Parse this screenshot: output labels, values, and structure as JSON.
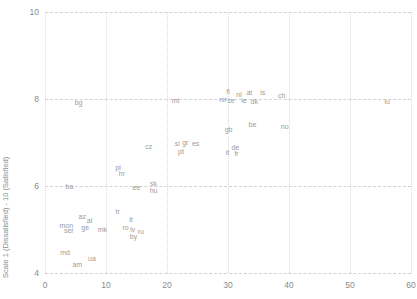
{
  "chart_data": {
    "type": "scatter",
    "title": "",
    "subtitle": "",
    "xlabel": "",
    "ylabel": "Life satisfaction",
    "ylabel_line2": "Scale 1 (Dissatisfied) - 10 (Satisfied)",
    "xlim": [
      0,
      60
    ],
    "ylim": [
      4,
      10
    ],
    "xticks": [
      0,
      10,
      20,
      30,
      40,
      50,
      60
    ],
    "yticks": [
      4,
      6,
      8,
      10
    ],
    "xtick_labels": [
      "0",
      "10",
      "20",
      "30",
      "40",
      "50",
      "60"
    ],
    "ytick_labels": [
      "4",
      "6",
      "8",
      "10"
    ],
    "grid": true,
    "legend": "none",
    "label_color": "#9b9b9b",
    "grid_color": "#dadada",
    "background": "#ffffff",
    "points": [
      {
        "label": "bg",
        "x": 5.5,
        "y": 7.92
      },
      {
        "label": "mt",
        "x": 21.4,
        "y": 7.97
      },
      {
        "label": "lu",
        "x": 56.1,
        "y": 7.96
      },
      {
        "label": "fi",
        "x": 30.0,
        "y": 8.18
      },
      {
        "label": "nir",
        "x": 29.2,
        "y": 8.0
      },
      {
        "label": "se",
        "x": 30.5,
        "y": 7.98
      },
      {
        "label": "nl",
        "x": 31.8,
        "y": 8.12
      },
      {
        "label": "ie",
        "x": 32.6,
        "y": 7.98
      },
      {
        "label": "at",
        "x": 33.5,
        "y": 8.17
      },
      {
        "label": "dk",
        "x": 34.3,
        "y": 7.95
      },
      {
        "label": "is",
        "x": 35.7,
        "y": 8.17
      },
      {
        "label": "ch",
        "x": 38.8,
        "y": 8.09
      },
      {
        "label": "gb",
        "x": 30.1,
        "y": 7.32
      },
      {
        "label": "be",
        "x": 34.0,
        "y": 7.43
      },
      {
        "label": "no",
        "x": 39.3,
        "y": 7.38
      },
      {
        "label": "cz",
        "x": 17.0,
        "y": 6.93
      },
      {
        "label": "si",
        "x": 21.7,
        "y": 6.99
      },
      {
        "label": "gr",
        "x": 23.0,
        "y": 7.01
      },
      {
        "label": "es",
        "x": 24.7,
        "y": 6.99
      },
      {
        "label": "pt",
        "x": 22.3,
        "y": 6.8
      },
      {
        "label": "de",
        "x": 31.2,
        "y": 6.9
      },
      {
        "label": "it",
        "x": 29.9,
        "y": 6.78
      },
      {
        "label": "fr",
        "x": 31.4,
        "y": 6.76
      },
      {
        "label": "pl",
        "x": 12.0,
        "y": 6.43
      },
      {
        "label": "hr",
        "x": 12.6,
        "y": 6.29
      },
      {
        "label": "ba",
        "x": 4.0,
        "y": 6.0
      },
      {
        "label": "ee",
        "x": 15.0,
        "y": 5.98
      },
      {
        "label": "sk",
        "x": 17.8,
        "y": 6.06
      },
      {
        "label": "hu",
        "x": 17.8,
        "y": 5.9
      },
      {
        "label": "tr",
        "x": 11.9,
        "y": 5.42
      },
      {
        "label": "az",
        "x": 6.1,
        "y": 5.32
      },
      {
        "label": "al",
        "x": 7.3,
        "y": 5.22
      },
      {
        "label": "lt",
        "x": 14.1,
        "y": 5.23
      },
      {
        "label": "mon",
        "x": 3.5,
        "y": 5.1
      },
      {
        "label": "ge",
        "x": 6.6,
        "y": 5.05
      },
      {
        "label": "ser",
        "x": 3.9,
        "y": 5.0
      },
      {
        "label": "mk",
        "x": 9.4,
        "y": 5.02
      },
      {
        "label": "ro",
        "x": 13.2,
        "y": 5.05
      },
      {
        "label": "lv",
        "x": 14.4,
        "y": 5.02
      },
      {
        "label": "ru",
        "x": 15.7,
        "y": 4.96
      },
      {
        "label": "by",
        "x": 14.5,
        "y": 4.86
      },
      {
        "label": "md",
        "x": 3.3,
        "y": 4.48
      },
      {
        "label": "ua",
        "x": 7.7,
        "y": 4.34
      },
      {
        "label": "am",
        "x": 5.3,
        "y": 4.2
      }
    ]
  }
}
